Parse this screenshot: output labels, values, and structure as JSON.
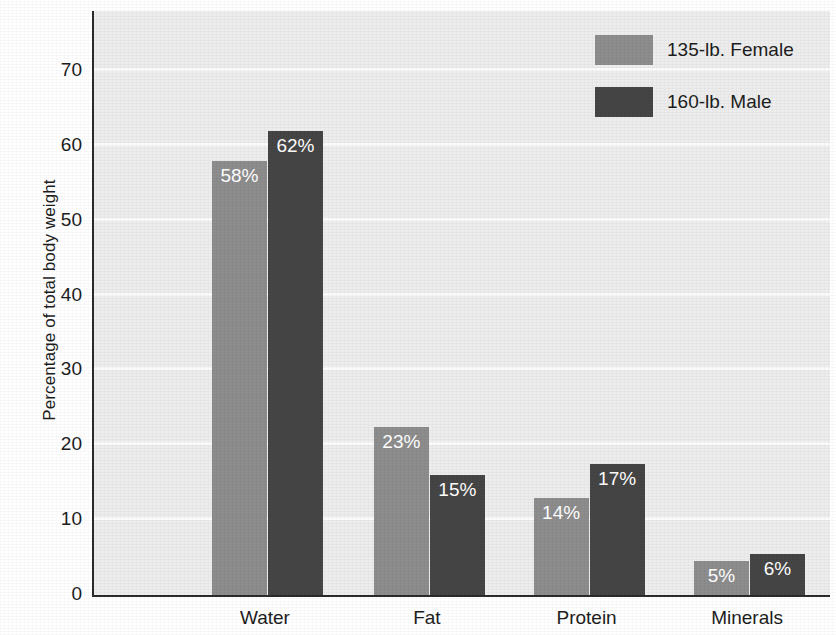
{
  "chart_data": {
    "type": "bar",
    "title": "",
    "xlabel": "",
    "ylabel": "Percentage of total body weight",
    "ylim": [
      0,
      78
    ],
    "yticks": [
      0,
      10,
      20,
      30,
      40,
      50,
      60,
      70
    ],
    "ytick_labels": [
      "0",
      "10",
      "20",
      "30",
      "40",
      "50",
      "60",
      "70"
    ],
    "grid": true,
    "legend_position": "top-right",
    "categories": [
      "Water",
      "Fat",
      "Protein",
      "Minerals"
    ],
    "series": [
      {
        "name": "135-lb. Female",
        "color": "#8d8d8d",
        "values": [
          58,
          23,
          14,
          5
        ],
        "bar_heights": [
          58,
          22.5,
          13,
          4.5
        ],
        "labels": [
          "58%",
          "23%",
          "14%",
          "5%"
        ]
      },
      {
        "name": "160-lb. Male",
        "color": "#454545",
        "values": [
          62,
          15,
          17,
          6
        ],
        "bar_heights": [
          62,
          16,
          17.5,
          5.5
        ],
        "labels": [
          "62%",
          "15%",
          "17%",
          "6%"
        ]
      }
    ]
  },
  "legend": {
    "items": [
      {
        "label": "135-lb. Female",
        "color": "#8d8d8d",
        "swatch": "legend-swatch-female"
      },
      {
        "label": "160-lb. Male",
        "color": "#454545",
        "swatch": "legend-swatch-male"
      }
    ]
  },
  "axes": {
    "y_title": "Percentage of total body weight",
    "plot_background": "#ededed",
    "gridline_color": "#fbfbfb",
    "axis_color": "#2b2b2b"
  }
}
